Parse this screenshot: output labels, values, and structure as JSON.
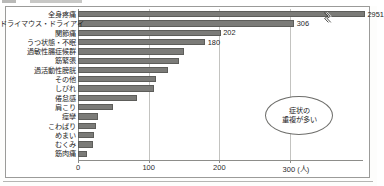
{
  "figure": {
    "unit_note": "(人)",
    "callout": {
      "line1": "症状の",
      "line2": "重複が多い"
    }
  },
  "chart_data": {
    "type": "bar",
    "orientation": "horizontal",
    "title": "",
    "subtitle": "",
    "xlabel": "(人)",
    "ylabel": "",
    "xlim": [
      0,
      300
    ],
    "xticks": [
      0,
      100,
      200,
      300
    ],
    "xtick_labels": [
      "0",
      "100",
      "200",
      "300"
    ],
    "grid": true,
    "legend": false,
    "axis_break": {
      "present": true,
      "on_category": "全身疼痛",
      "note": "値2951はスケール外のため軸を省略"
    },
    "categories": [
      "全身疼痛",
      "ドライマウス・ドライアイ",
      "関節痛",
      "うつ状態・不眠",
      "過敏性腸症候群",
      "筋緊張",
      "過活動性膀胱",
      "その他",
      "しびれ",
      "倦怠感",
      "肩こり",
      "痙攣",
      "こわばり",
      "めまい",
      "むくみ",
      "筋肉痛"
    ],
    "values": [
      2951,
      306,
      202,
      180,
      150,
      143,
      128,
      111,
      108,
      83,
      49,
      29,
      25,
      23,
      21,
      13
    ],
    "value_labels": [
      "2951",
      "306",
      "202",
      "180",
      "",
      "",
      "",
      "",
      "",
      "",
      "",
      "",
      "",
      "",
      "",
      ""
    ],
    "bar_color": "#7b7b78",
    "bar_edge_color": "#5d5d5a",
    "grid_color": "#c3c3c0",
    "axis_color": "#8d8d8a",
    "text_color": "#1e1e1e",
    "annotations": [
      {
        "text": "症状の重複が多い",
        "type": "callout-ellipse"
      }
    ]
  }
}
